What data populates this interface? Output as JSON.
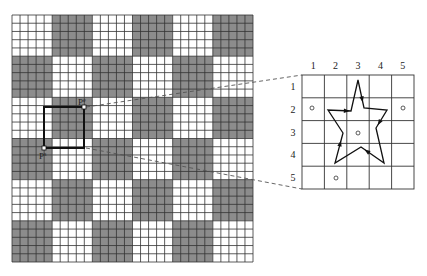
{
  "left_grid": {
    "cells": 30,
    "block_size": 5,
    "x": 12,
    "y": 15,
    "width": 241,
    "height": 247,
    "dark_color": "#8c8c8c",
    "light_color": "#ffffff",
    "line_color": "#333333"
  },
  "selection": {
    "x1": 44,
    "y1": 107,
    "x2": 84,
    "y2": 148,
    "point_end": {
      "label": "P",
      "sup": "e"
    },
    "point_start": {
      "label": "P",
      "sup": "s"
    }
  },
  "right_grid": {
    "x": 302,
    "y": 75,
    "width": 112,
    "height": 114,
    "column_labels": [
      "1",
      "2",
      "3",
      "4",
      "5"
    ],
    "row_labels": [
      "1",
      "2",
      "3",
      "4",
      "5"
    ]
  },
  "star": {
    "points": [
      [
        358,
        80
      ],
      [
        364,
        108
      ],
      [
        387,
        110
      ],
      [
        376,
        128
      ],
      [
        384,
        163
      ],
      [
        361,
        147
      ],
      [
        335,
        163
      ],
      [
        343,
        133
      ],
      [
        328,
        110
      ],
      [
        351,
        111
      ]
    ]
  },
  "circles": [
    [
      312,
      108
    ],
    [
      403,
      108
    ],
    [
      358,
      133
    ],
    [
      336,
      178
    ]
  ]
}
